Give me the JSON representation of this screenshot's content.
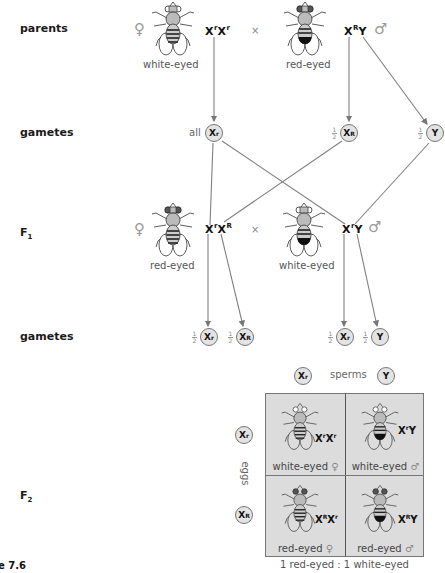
{
  "rows": {
    "parents": "parents",
    "gametes1": "gametes",
    "f1": "F",
    "f1_sub": "1",
    "gametes2": "gametes",
    "f2": "F",
    "f2_sub": "2"
  },
  "parents": {
    "female": {
      "sex_symbol": "♀",
      "phenotype": "white-eyed",
      "genotype": [
        {
          "base": "X",
          "sup": "r"
        },
        {
          "base": "X",
          "sup": "r"
        }
      ],
      "eyes": "white"
    },
    "cross_symbol": "×",
    "male": {
      "sex_symbol": "♂",
      "phenotype": "red-eyed",
      "genotype": [
        {
          "base": "X",
          "sup": "R"
        },
        {
          "base": "Y",
          "sup": ""
        }
      ],
      "eyes": "red"
    }
  },
  "gametes1": {
    "female_prefix": "all",
    "female": {
      "base": "X",
      "sup": "r"
    },
    "male1": {
      "frac_n": "1",
      "frac_d": "2",
      "base": "X",
      "sup": "R"
    },
    "male2": {
      "frac_n": "1",
      "frac_d": "2",
      "base": "Y",
      "sup": ""
    }
  },
  "f1": {
    "female": {
      "sex_symbol": "♀",
      "phenotype": "red-eyed",
      "genotype": [
        {
          "base": "X",
          "sup": "r"
        },
        {
          "base": "X",
          "sup": "R"
        }
      ],
      "eyes": "red"
    },
    "cross_symbol": "×",
    "male": {
      "sex_symbol": "♂",
      "phenotype": "white-eyed",
      "genotype": [
        {
          "base": "X",
          "sup": "r"
        },
        {
          "base": "Y",
          "sup": ""
        }
      ],
      "eyes": "white"
    }
  },
  "gametes2": [
    {
      "frac_n": "1",
      "frac_d": "2",
      "base": "X",
      "sup": "r"
    },
    {
      "frac_n": "1",
      "frac_d": "2",
      "base": "X",
      "sup": "R"
    },
    {
      "frac_n": "1",
      "frac_d": "2",
      "base": "X",
      "sup": "r"
    },
    {
      "frac_n": "1",
      "frac_d": "2",
      "base": "Y",
      "sup": ""
    }
  ],
  "punnett": {
    "sperm_label": "sperms",
    "egg_label": "eggs",
    "sperms": [
      {
        "base": "X",
        "sup": "r"
      },
      {
        "base": "Y",
        "sup": ""
      }
    ],
    "eggs": [
      {
        "base": "X",
        "sup": "r"
      },
      {
        "base": "X",
        "sup": "R"
      }
    ],
    "cells": [
      {
        "genotype_base1": "X",
        "genotype_sup1": "r",
        "genotype_base2": "X",
        "genotype_sup2": "r",
        "phenotype": "white-eyed",
        "sex_symbol": "♀",
        "eyes": "white",
        "sex": "female"
      },
      {
        "genotype_base1": "X",
        "genotype_sup1": "r",
        "genotype_base2": "Y",
        "genotype_sup2": "",
        "phenotype": "white-eyed",
        "sex_symbol": "♂",
        "eyes": "white",
        "sex": "male"
      },
      {
        "genotype_base1": "X",
        "genotype_sup1": "R",
        "genotype_base2": "X",
        "genotype_sup2": "r",
        "phenotype": "red-eyed",
        "sex_symbol": "♀",
        "eyes": "red",
        "sex": "female"
      },
      {
        "genotype_base1": "X",
        "genotype_sup1": "R",
        "genotype_base2": "Y",
        "genotype_sup2": "",
        "phenotype": "red-eyed",
        "sex_symbol": "♂",
        "eyes": "red",
        "sex": "male"
      }
    ],
    "ratio": "1 red-eyed : 1 white-eyed"
  },
  "caption_fragment": "e 7.6",
  "colors": {
    "line": "#777777",
    "gamete_fill": "#e3e3e3",
    "grid_fill": "#dcdcdc",
    "label_gray": "#555555"
  }
}
